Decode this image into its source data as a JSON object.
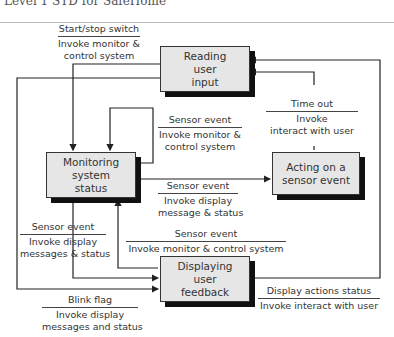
{
  "header": {
    "title": "Level 1 STD for SafeHome"
  },
  "states": {
    "reading": [
      "Reading",
      "user",
      "input"
    ],
    "monitoring": [
      "Monitoring",
      "system",
      "status"
    ],
    "acting": [
      "Acting on a",
      "sensor event"
    ],
    "displaying": [
      "Displaying",
      "user",
      "feedback"
    ]
  },
  "transitions": {
    "start_stop": {
      "event": "Start/stop switch",
      "action": [
        "Invoke monitor &",
        "control system"
      ]
    },
    "self_loop": {
      "event": "Sensor event",
      "action": [
        "Invoke monitor &",
        "control system"
      ]
    },
    "time_out": {
      "event": "Time out",
      "action": [
        "Invoke",
        "interact with user"
      ]
    },
    "to_acting": {
      "event": "Sensor event",
      "action": [
        "Invoke display",
        "message & status"
      ]
    },
    "display_to_monitor": {
      "event": "Sensor event",
      "action": [
        "Invoke monitor & control system"
      ]
    },
    "monitor_to_display": {
      "event": "Sensor event",
      "action": [
        "Invoke display",
        "messages & status"
      ]
    },
    "blink": {
      "event": "Blink flag",
      "action": [
        "Invoke display",
        "messages and status"
      ]
    },
    "display_actions": {
      "event": "Display actions status",
      "action": [
        "Invoke interact with user"
      ]
    }
  },
  "colors": {
    "state_fill": "#e6e6e6",
    "line": "#222222",
    "shadow": "#111111"
  }
}
